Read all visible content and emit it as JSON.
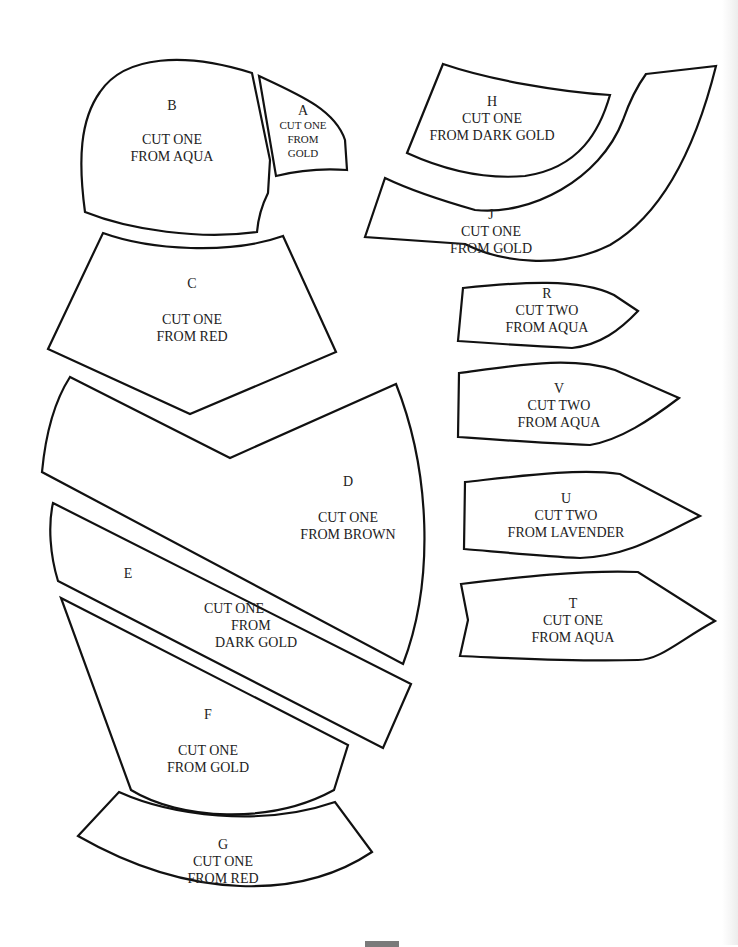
{
  "document": {
    "type": "applique pattern sheet",
    "pieces": [
      {
        "id": "A",
        "lines": [
          "A",
          "CUT ONE",
          "FROM",
          "GOLD"
        ],
        "quantity": "ONE",
        "color": "GOLD"
      },
      {
        "id": "B",
        "lines": [
          "B",
          "",
          "CUT ONE",
          "FROM AQUA"
        ],
        "quantity": "ONE",
        "color": "AQUA"
      },
      {
        "id": "C",
        "lines": [
          "C",
          "",
          "CUT ONE",
          "FROM RED"
        ],
        "quantity": "ONE",
        "color": "RED"
      },
      {
        "id": "D",
        "lines": [
          "D",
          "",
          "CUT ONE",
          "FROM BROWN"
        ],
        "quantity": "ONE",
        "color": "BROWN"
      },
      {
        "id": "E",
        "label": "E",
        "lines": [
          "CUT ONE",
          "FROM",
          "DARK GOLD"
        ],
        "quantity": "ONE",
        "color": "DARK GOLD"
      },
      {
        "id": "F",
        "lines": [
          "F",
          "",
          "CUT ONE",
          "FROM GOLD"
        ],
        "quantity": "ONE",
        "color": "GOLD"
      },
      {
        "id": "G",
        "lines": [
          "G",
          "CUT ONE",
          "FROM RED"
        ],
        "quantity": "ONE",
        "color": "RED"
      },
      {
        "id": "H",
        "lines": [
          "H",
          "CUT ONE",
          "FROM DARK GOLD"
        ],
        "quantity": "ONE",
        "color": "DARK GOLD"
      },
      {
        "id": "J",
        "lines": [
          "J",
          "CUT ONE",
          "FROM GOLD"
        ],
        "quantity": "ONE",
        "color": "GOLD"
      },
      {
        "id": "R",
        "lines": [
          "R",
          "CUT TWO",
          "FROM AQUA"
        ],
        "quantity": "TWO",
        "color": "AQUA"
      },
      {
        "id": "V",
        "lines": [
          "V",
          "CUT TWO",
          "FROM AQUA"
        ],
        "quantity": "TWO",
        "color": "AQUA"
      },
      {
        "id": "U",
        "lines": [
          "U",
          "CUT TWO",
          "FROM LAVENDER"
        ],
        "quantity": "TWO",
        "color": "LAVENDER"
      },
      {
        "id": "T",
        "lines": [
          "T",
          "CUT ONE",
          "FROM AQUA"
        ],
        "quantity": "ONE",
        "color": "AQUA"
      }
    ]
  },
  "colors": {
    "outline": "#111111",
    "text": "#222222",
    "paper": "#ffffff"
  }
}
